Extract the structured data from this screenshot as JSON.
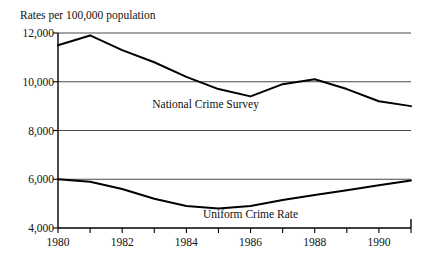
{
  "chart_data": {
    "type": "line",
    "title": "Rates per 100,000 population",
    "xlabel": "",
    "ylabel": "",
    "xlim": [
      1980,
      1991
    ],
    "ylim": [
      4000,
      12000
    ],
    "yticks": [
      4000,
      6000,
      8000,
      10000,
      12000
    ],
    "ytick_labels": [
      "4,000",
      "6,000",
      "8,000",
      "10,000",
      "12,000"
    ],
    "xticks": [
      1980,
      1981,
      1982,
      1983,
      1984,
      1985,
      1986,
      1987,
      1988,
      1989,
      1990,
      1991
    ],
    "xtick_labels": [
      "1980",
      "",
      "1982",
      "",
      "1984",
      "",
      "1986",
      "",
      "1988",
      "",
      "1990",
      ""
    ],
    "x": [
      1980,
      1981,
      1982,
      1983,
      1984,
      1985,
      1986,
      1987,
      1988,
      1989,
      1990,
      1991
    ],
    "grid": "horizontal-at-yticks",
    "legend_position": "inline-annotations",
    "series": [
      {
        "name": "National Crime Survey",
        "values": [
          11500,
          11900,
          11300,
          10800,
          10200,
          9700,
          9400,
          9900,
          10100,
          9700,
          9200,
          9000
        ],
        "color": "#000000",
        "label_x": 1984.6,
        "label_y": 9050
      },
      {
        "name": "Uniform Crime Rate",
        "values": [
          6000,
          5900,
          5600,
          5200,
          4900,
          4800,
          4900,
          5150,
          5350,
          5550,
          5750,
          5950
        ],
        "color": "#000000",
        "label_x": 1986.0,
        "label_y": 4520
      }
    ],
    "annotations": [
      {
        "text": "National Crime Survey",
        "series": "National Crime Survey"
      },
      {
        "text": "Uniform Crime Rate",
        "series": "Uniform Crime Rate"
      }
    ],
    "axis_color": "#000000",
    "grid_color": "#4a4a4a",
    "background": "#ffffff"
  }
}
